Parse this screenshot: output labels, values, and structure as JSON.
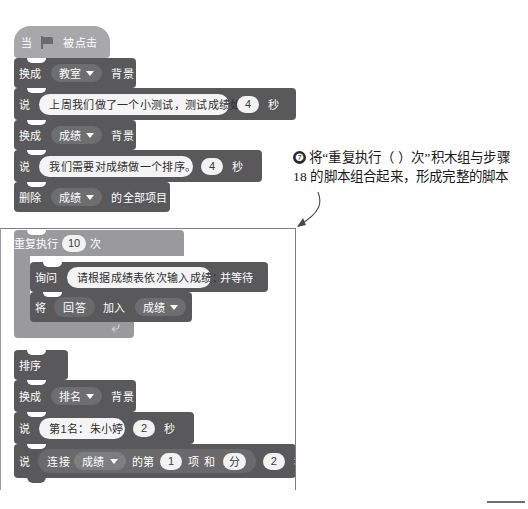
{
  "doc": {
    "type": "scratch-script-figure",
    "language": "zh-CN"
  },
  "script": {
    "blocks": [
      {
        "id": "hat",
        "kind": "hat",
        "shade": "hat",
        "label_left": "当",
        "icon": "green-flag-icon",
        "label_right": "被点击"
      },
      {
        "id": "switch-backdrop-1",
        "kind": "stack",
        "shade": "dark",
        "label_left": "换成",
        "dropdown": "教室",
        "label_right": "背景"
      },
      {
        "id": "say-1",
        "kind": "stack",
        "shade": "dark",
        "label_left": "说",
        "text": "上周我们做了一个小测试，测试成绩如下：",
        "number": "4",
        "label_right": "秒"
      },
      {
        "id": "switch-backdrop-2",
        "kind": "stack",
        "shade": "dark",
        "label_left": "换成",
        "dropdown": "成绩",
        "label_right": "背景"
      },
      {
        "id": "say-2",
        "kind": "stack",
        "shade": "dark",
        "label_left": "说",
        "text": "我们需要对成绩做一个排序。",
        "number": "4",
        "label_right": "秒"
      },
      {
        "id": "delete-all",
        "kind": "stack",
        "shade": "dark",
        "label_left": "删除",
        "dropdown": "成绩",
        "label_right": "的全部项目"
      },
      {
        "id": "repeat",
        "kind": "c-block",
        "shade": "light",
        "label_left": "重复执行",
        "number": "10",
        "label_right": "次",
        "children": [
          {
            "id": "ask-wait",
            "kind": "stack",
            "shade": "dark",
            "label_left": "询问",
            "text": "请根据成绩表依次输入成绩：",
            "label_right": "并等待"
          },
          {
            "id": "add-to-list",
            "kind": "stack",
            "shade": "dark",
            "label_left": "将",
            "reporter": "回答",
            "label_mid": "加入",
            "dropdown": "成绩"
          }
        ]
      },
      {
        "id": "sort",
        "kind": "stack",
        "shade": "dark",
        "label_left": "排序"
      },
      {
        "id": "switch-backdrop-3",
        "kind": "stack",
        "shade": "dark",
        "label_left": "换成",
        "dropdown": "排名",
        "label_right": "背景"
      },
      {
        "id": "say-3",
        "kind": "stack",
        "shade": "dark",
        "label_left": "说",
        "text": "第1名：朱小婷",
        "number": "2",
        "label_right": "秒"
      },
      {
        "id": "say-join",
        "kind": "stack",
        "shade": "dark",
        "label_left": "说",
        "join_label": "连接",
        "dropdown": "成绩",
        "label_item": "的第",
        "index": "1",
        "label_xiang": "项",
        "label_he": "和",
        "unit": "分",
        "number": "2",
        "label_right": "秒"
      }
    ]
  },
  "callout": {
    "number": "❼",
    "text": "将“重复执行（ ）次”积木组与步骤 18 的脚本组合起来，形成完整的脚本"
  },
  "colors": {
    "block_dark": "#59595b",
    "block_light": "#9a9a9c",
    "hat": "#a8a8aa",
    "input_white": "#f2f2f2",
    "dropdown": "#6e6e70",
    "page_bg": "#ffffff",
    "frame_line": "#7d7d7d"
  }
}
